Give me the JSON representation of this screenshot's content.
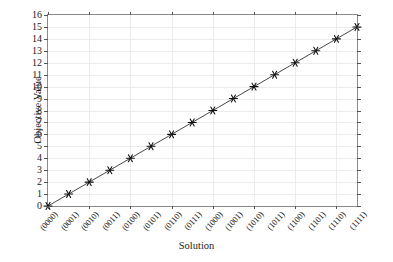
{
  "chart_data": {
    "type": "line",
    "title": "",
    "xlabel": "Solution",
    "ylabel": "Objective Value",
    "categories": [
      "(0000)",
      "(0001)",
      "(0010)",
      "(0011)",
      "(0100)",
      "(0101)",
      "(0110)",
      "(0111)",
      "(1000)",
      "(1001)",
      "(1010)",
      "(1011)",
      "(1100)",
      "(1101)",
      "(1110)",
      "(1111)"
    ],
    "values": [
      0,
      1,
      2,
      3,
      4,
      5,
      6,
      7,
      8,
      9,
      10,
      11,
      12,
      13,
      14,
      15
    ],
    "ylim": [
      0,
      16
    ],
    "yticks": [
      0,
      1,
      2,
      3,
      4,
      5,
      6,
      7,
      8,
      9,
      10,
      11,
      12,
      13,
      14,
      15,
      16
    ],
    "ytick_labels": [
      "0",
      "1",
      "2",
      "3",
      "4",
      "5",
      "6",
      "7",
      "8",
      "9",
      "10",
      "11",
      "12",
      "13",
      "14",
      "15",
      "16"
    ],
    "grid": true,
    "grid_color": "#ececec",
    "legend": null,
    "marker": "star",
    "marker_color": "#111111",
    "line_color": "#333333",
    "axis_color": "#8a8a8a",
    "background": "#ffffff",
    "vertical_gridline_every": 2
  }
}
